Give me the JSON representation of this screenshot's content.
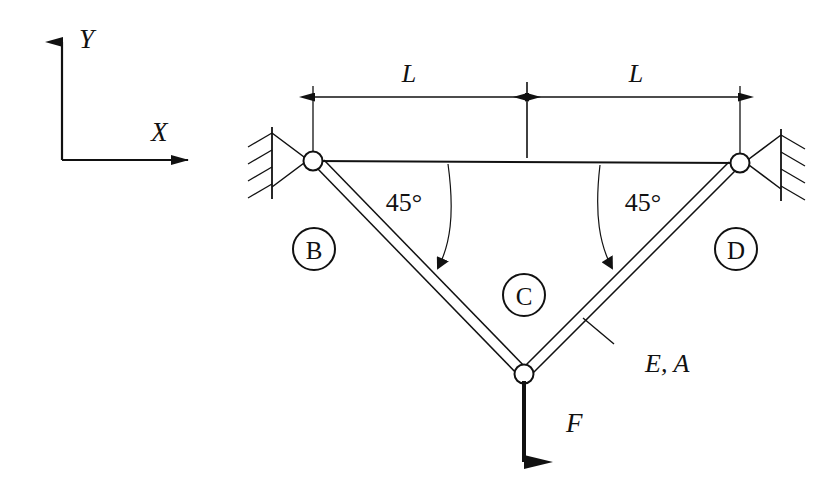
{
  "figure": {
    "type": "engineering-diagram",
    "background_color": "#ffffff",
    "line_color": "#1a1a1a"
  },
  "axes": {
    "y_label": "Y",
    "x_label": "X"
  },
  "dimensions": {
    "left_label": "L",
    "right_label": "L"
  },
  "angles": {
    "left": "45°",
    "right": "45°"
  },
  "nodes": {
    "left": "B",
    "apex": "C",
    "right": "D"
  },
  "annotations": {
    "material": "E, A",
    "force": "F"
  }
}
